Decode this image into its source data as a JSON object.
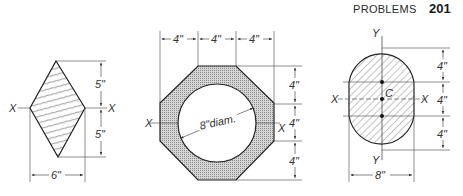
{
  "header": {
    "title": "PROBLEMS",
    "page_number": "201"
  },
  "figures": {
    "rhombus": {
      "axis_left": "X",
      "axis_right": "X",
      "dim_upper": "5\"",
      "dim_lower": "5\"",
      "dim_width": "6\""
    },
    "octagon": {
      "axis_left": "X",
      "axis_right": "X",
      "dim_top": [
        "4\"",
        "4\"",
        "4\""
      ],
      "dim_right": [
        "4\"",
        "4\"",
        "4\""
      ],
      "hole_label": "8\"diam."
    },
    "stadium": {
      "axis_top": "Y",
      "axis_bottom": "Y",
      "axis_left": "X",
      "axis_right": "X",
      "centroid": "C",
      "dim_right": [
        "4\"",
        "4\"",
        "4\""
      ],
      "dim_width": "8\""
    }
  },
  "colors": {
    "ink": "#333333",
    "paper": "#ffffff",
    "stipple": "#b8b8b8"
  }
}
